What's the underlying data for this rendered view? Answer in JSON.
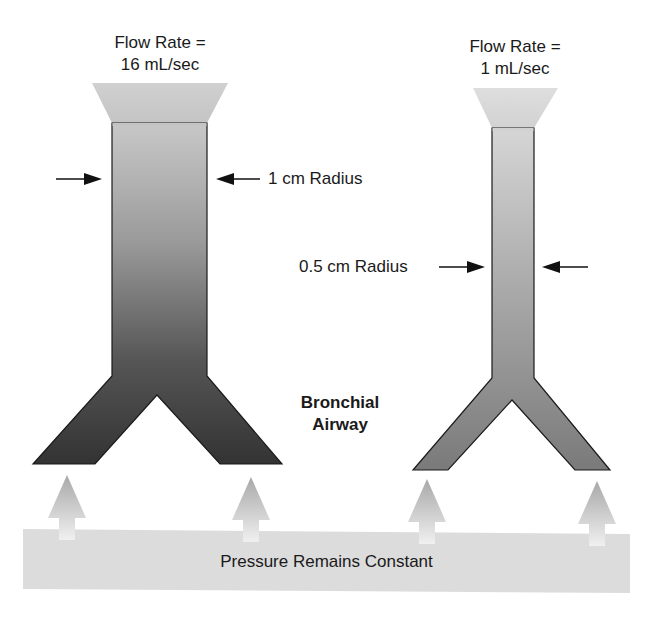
{
  "left_airway": {
    "flow_label_line1": "Flow Rate =",
    "flow_label_line2": "16 mL/sec",
    "radius_label": "1 cm Radius",
    "flow_rate_ml_per_sec": 16,
    "radius_cm": 1,
    "fill_top": "#c4c4c4",
    "fill_bottom": "#3c3c3c"
  },
  "right_airway": {
    "flow_label_line1": "Flow Rate =",
    "flow_label_line2": "1 mL/sec",
    "radius_label": "0.5 cm Radius",
    "flow_rate_ml_per_sec": 1,
    "radius_cm": 0.5,
    "fill_top": "#d2d2d2",
    "fill_bottom": "#7a7a7a"
  },
  "center_label_line1": "Bronchial",
  "center_label_line2": "Airway",
  "pressure_bar": {
    "label": "Pressure Remains Constant",
    "color": "#dcdcdc"
  },
  "pressure_arrows": {
    "count": 4,
    "icon": "up-arrow-icon"
  }
}
